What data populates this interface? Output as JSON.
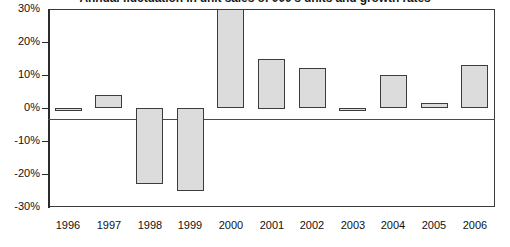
{
  "chart_data": {
    "type": "bar",
    "title": "Annual fluctuation in unit sales of 000's units and growth rates",
    "subtitle": "",
    "xlabel": "",
    "ylabel": "",
    "categories": [
      "1996",
      "1997",
      "1998",
      "1999",
      "2000",
      "2001",
      "2002",
      "2003",
      "2004",
      "2005",
      "2006"
    ],
    "values": [
      -1,
      4,
      -23,
      -25,
      30,
      15,
      12,
      -0.5,
      10,
      1.5,
      13
    ],
    "value_labels": [
      "-1%",
      "4%",
      "-23%",
      "-25%",
      "30%",
      "15%",
      "12%",
      "0%",
      "10%",
      "1%",
      "13%"
    ],
    "ylim": [
      -30,
      30
    ],
    "ytick_values": [
      30,
      20,
      10,
      0,
      -10,
      -20,
      -30
    ],
    "ytick_labels": [
      "30%",
      "20%",
      "10%",
      "0%",
      "-10%",
      "-20%",
      "-30%"
    ],
    "grid": false,
    "legend": false,
    "legend_position": "none",
    "bar_fill_color": "#dcdcdc",
    "bar_border_color": "#3c3c3c",
    "axis_color": "#2b2b2b",
    "background_color": "#ffffff"
  }
}
